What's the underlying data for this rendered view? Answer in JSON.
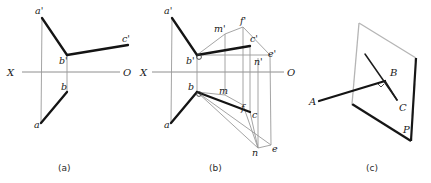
{
  "figure": {
    "background": "#ffffff",
    "ink_color": "#141414",
    "thin_color": "#9a9a9a",
    "axis_color": "#8e8e8e",
    "width": 431,
    "height": 183
  },
  "captions": [
    {
      "id": "cap-a",
      "text": "(a)",
      "x": 65,
      "y": 171
    },
    {
      "id": "cap-b",
      "text": "(b)",
      "x": 216,
      "y": 171
    },
    {
      "id": "cap-c",
      "text": "(c)",
      "x": 373,
      "y": 171
    }
  ],
  "panel_a": {
    "name": "projection-view-a",
    "axis": {
      "label_left": "X",
      "label_right": "O",
      "y": 72,
      "x_start": 22,
      "x_end": 120,
      "label_left_pos": {
        "x": 10,
        "y": 76
      },
      "label_right_pos": {
        "x": 124,
        "y": 76
      }
    },
    "points": [
      {
        "id": "a-prime",
        "label": "a'",
        "x": 42,
        "y": 18,
        "label_x": 35,
        "label_y": 14
      },
      {
        "id": "b-prime",
        "label": "b'",
        "x": 67,
        "y": 55,
        "label_x": 59,
        "label_y": 64
      },
      {
        "id": "c-prime",
        "label": "c'",
        "x": 128,
        "y": 45,
        "label_x": 122,
        "label_y": 42
      },
      {
        "id": "b-point",
        "label": "b",
        "x": 67,
        "y": 92,
        "label_x": 61,
        "label_y": 90
      },
      {
        "id": "a-point",
        "label": "a",
        "x": 41,
        "y": 123,
        "label_x": 34,
        "label_y": 128
      }
    ],
    "segments": [
      {
        "id": "seg-ap-bp",
        "kind": "bold",
        "from": "a-prime",
        "to": "b-prime"
      },
      {
        "id": "seg-bp-cp",
        "kind": "bold",
        "from": "b-prime",
        "to": "c-prime"
      },
      {
        "id": "seg-a-b",
        "kind": "bold",
        "from": "a-point",
        "to": "b-point"
      },
      {
        "id": "seg-vertical-projector",
        "kind": "thin",
        "from": "a-prime",
        "to": "a-point"
      }
    ]
  },
  "panel_b": {
    "name": "projection-view-b",
    "axis": {
      "label_left": "X",
      "label_right": "O",
      "y": 72,
      "x_start": 152,
      "x_end": 284,
      "label_left_pos": {
        "x": 142,
        "y": 76
      },
      "label_right_pos": {
        "x": 288,
        "y": 76
      }
    },
    "points": [
      {
        "id": "a-prime",
        "label": "a'",
        "x": 172,
        "y": 18,
        "label_x": 164,
        "label_y": 14
      },
      {
        "id": "b-prime",
        "label": "b'",
        "x": 197,
        "y": 55,
        "label_x": 188,
        "label_y": 64
      },
      {
        "id": "c-prime",
        "label": "c'",
        "x": 250,
        "y": 46,
        "label_x": 250,
        "label_y": 42
      },
      {
        "id": "m-prime",
        "label": "m'",
        "x": 225,
        "y": 34,
        "label_x": 216,
        "label_y": 32
      },
      {
        "id": "f-prime",
        "label": "f'",
        "x": 243,
        "y": 27,
        "label_x": 240,
        "label_y": 25
      },
      {
        "id": "n-prime",
        "label": "n'",
        "x": 258,
        "y": 58,
        "label_x": 255,
        "label_y": 64
      },
      {
        "id": "e-prime",
        "label": "e'",
        "x": 270,
        "y": 55,
        "label_x": 268,
        "label_y": 57
      },
      {
        "id": "b-point",
        "label": "b",
        "x": 197,
        "y": 92,
        "label_x": 189,
        "label_y": 90
      },
      {
        "id": "a-point",
        "label": "a",
        "x": 171,
        "y": 123,
        "label_x": 164,
        "label_y": 128
      },
      {
        "id": "c-point",
        "label": "c",
        "x": 250,
        "y": 112,
        "label_x": 252,
        "label_y": 116
      },
      {
        "id": "m-point",
        "label": "m",
        "x": 225,
        "y": 95,
        "label_x": 220,
        "label_y": 94
      },
      {
        "id": "f-point",
        "label": "f",
        "x": 243,
        "y": 105,
        "label_x": 242,
        "label_y": 110
      },
      {
        "id": "n-point",
        "label": "n",
        "x": 258,
        "y": 148,
        "label_x": 254,
        "label_y": 153
      },
      {
        "id": "e-point",
        "label": "e",
        "x": 271,
        "y": 145,
        "label_x": 272,
        "label_y": 150
      }
    ],
    "segments": [
      {
        "id": "seg-ap-bp",
        "kind": "bold"
      },
      {
        "id": "seg-bp-cp",
        "kind": "bold"
      },
      {
        "id": "seg-a-b",
        "kind": "bold"
      },
      {
        "id": "seg-b-c",
        "kind": "bold"
      },
      {
        "id": "seg-bp-mp",
        "kind": "thin"
      },
      {
        "id": "seg-bp-np",
        "kind": "thin"
      },
      {
        "id": "seg-b-n",
        "kind": "thin"
      },
      {
        "id": "seg-b-m",
        "kind": "thin"
      },
      {
        "id": "seg-c-n",
        "kind": "thin"
      },
      {
        "id": "seg-mp-m",
        "kind": "thin"
      },
      {
        "id": "seg-fp-f",
        "kind": "thin"
      },
      {
        "id": "seg-np-n",
        "kind": "thin"
      },
      {
        "id": "seg-ep-e",
        "kind": "thin"
      }
    ]
  },
  "panel_c": {
    "name": "pictorial-view-c",
    "plane_label": "P",
    "plane_label_pos": {
      "x": 406,
      "y": 131
    },
    "plane_vertices": [
      {
        "x": 359,
        "y": 23
      },
      {
        "x": 416,
        "y": 58
      },
      {
        "x": 411,
        "y": 141
      },
      {
        "x": 352,
        "y": 104
      }
    ],
    "points": [
      {
        "id": "A",
        "label": "A",
        "x": 319,
        "y": 101,
        "label_x": 311,
        "label_y": 104
      },
      {
        "id": "B",
        "label": "B",
        "x": 385,
        "y": 81,
        "label_x": 392,
        "label_y": 76
      },
      {
        "id": "C",
        "label": "C",
        "x": 397,
        "y": 100,
        "label_x": 400,
        "label_y": 110
      }
    ],
    "segments": [
      {
        "id": "seg-A-B",
        "kind": "bold"
      },
      {
        "id": "seg-B-C",
        "kind": "med"
      },
      {
        "id": "seg-B-up",
        "kind": "med"
      }
    ]
  }
}
